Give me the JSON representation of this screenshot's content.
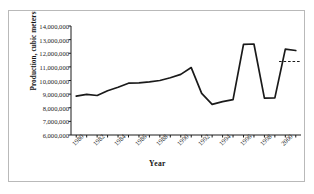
{
  "chart_data": {
    "type": "line",
    "title": "",
    "xlabel": "Year",
    "ylabel": "Production, cubic meters",
    "xlim": [
      1979.5,
      2001.5
    ],
    "ylim": [
      6000000,
      14000000
    ],
    "grid": false,
    "legend": "none",
    "ytick_labels": [
      "14,000,000",
      "13,000,000",
      "12,000,000",
      "11,000,000",
      "10,000,000",
      "9,000,000",
      "8,000,000",
      "7,000,000",
      "6,000,000"
    ],
    "ytick_values": [
      14000000,
      13000000,
      12000000,
      11000000,
      10000000,
      9000000,
      8000000,
      7000000,
      6000000
    ],
    "xtick_labels": [
      "1980",
      "1982",
      "1984",
      "1986",
      "1988",
      "1990",
      "1992",
      "1994",
      "1996",
      "1998",
      "2000"
    ],
    "xtick_values": [
      1980,
      1982,
      1984,
      1986,
      1988,
      1990,
      1992,
      1994,
      1996,
      1998,
      2000
    ],
    "x": [
      1980,
      1981,
      1982,
      1983,
      1984,
      1985,
      1986,
      1987,
      1988,
      1989,
      1990,
      1991,
      1992,
      1993,
      1994,
      1995,
      1996,
      1997,
      1998,
      1999,
      2000,
      2001
    ],
    "series": [
      {
        "name": "Production",
        "style": "solid",
        "color": "#1a1a1a",
        "values": [
          8850000,
          8980000,
          8900000,
          9250000,
          9500000,
          9800000,
          9830000,
          9900000,
          10000000,
          10200000,
          10450000,
          10950000,
          9050000,
          8250000,
          8450000,
          8600000,
          12650000,
          12680000,
          8700000,
          8720000,
          12300000,
          12200000
        ]
      },
      {
        "name": "Reference level",
        "style": "dashed",
        "color": "#1a1a1a",
        "x_start": 1999.4,
        "x_end": 2001.5,
        "value": 11400000
      }
    ]
  }
}
